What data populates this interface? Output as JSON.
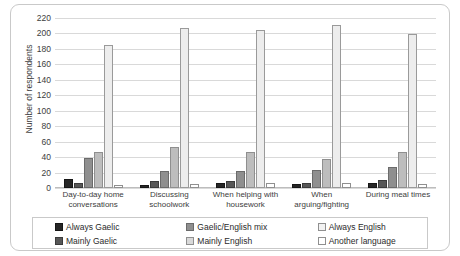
{
  "chart_data": {
    "type": "bar",
    "title": "",
    "xlabel": "",
    "ylabel": "Number of respondents",
    "ylim": [
      0,
      220
    ],
    "ytick_step": 20,
    "yticks": [
      220,
      200,
      180,
      160,
      140,
      120,
      100,
      80,
      60,
      40,
      20,
      0
    ],
    "grid": "horizontal",
    "legend_position": "bottom",
    "legend_columns": 3,
    "categories": [
      "Day-to-day home conversations",
      "Discussing schoolwork",
      "When helping with housework",
      "When arguing/fighting",
      "During meal times"
    ],
    "series": [
      {
        "name": "Always Gaelic",
        "color": "#262626",
        "values": [
          12,
          4,
          7,
          5,
          6
        ]
      },
      {
        "name": "Mainly Gaelic",
        "color": "#575757",
        "values": [
          6,
          9,
          9,
          6,
          11
        ]
      },
      {
        "name": "Gaelic/English mix",
        "color": "#8f8f8f",
        "values": [
          39,
          22,
          22,
          23,
          27
        ]
      },
      {
        "name": "Mainly English",
        "color": "#bdbdbd",
        "values": [
          46,
          53,
          47,
          38,
          47
        ]
      },
      {
        "name": "Always English",
        "color": "#ededed",
        "values": [
          185,
          207,
          204,
          211,
          199
        ]
      },
      {
        "name": "Another language",
        "color": "#ffffff",
        "values": [
          4,
          5,
          6,
          6,
          5
        ]
      }
    ]
  }
}
